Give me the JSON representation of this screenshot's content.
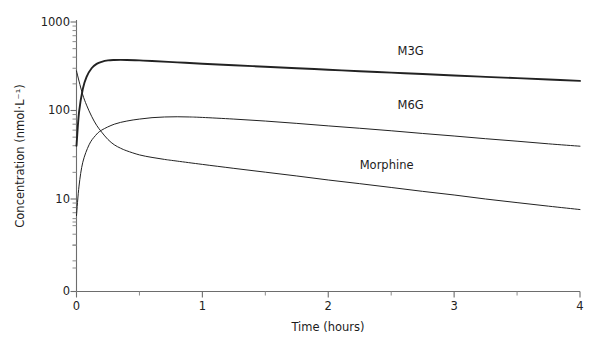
{
  "chart_data": {
    "type": "line",
    "title": "",
    "subtitle": "",
    "xlabel": "Time (hours)",
    "ylabel": "Concentration (nmol·L⁻¹)",
    "xlim": [
      0,
      4
    ],
    "ylim": [
      0,
      1000
    ],
    "yscale": "log",
    "xscale": "linear",
    "grid": false,
    "legend_position": "inline-right",
    "x_ticks": [
      "0",
      "1",
      "2",
      "3",
      "4"
    ],
    "x_tick_values": [
      0,
      1,
      2,
      3,
      4
    ],
    "x_minor_tick_values": [
      0.5,
      1.5,
      2.5,
      3.5
    ],
    "y_ticks": [
      "0",
      "10",
      "100",
      "1000"
    ],
    "y_tick_values": [
      0,
      10,
      100,
      1000
    ],
    "series": [
      {
        "name": "M3G",
        "label": "M3G",
        "color": "#222222",
        "x": [
          0,
          0.02,
          0.05,
          0.08,
          0.12,
          0.16,
          0.2,
          0.25,
          0.3,
          0.35,
          0.4,
          0.5,
          0.6,
          0.8,
          1.0,
          1.25,
          1.5,
          1.75,
          2.0,
          2.25,
          2.5,
          2.75,
          3.0,
          3.25,
          3.5,
          3.75,
          4.0
        ],
        "y": [
          40,
          95,
          175,
          240,
          300,
          336,
          355,
          368,
          372,
          373,
          372,
          368,
          362,
          350,
          338,
          325,
          312,
          300,
          289,
          278,
          268,
          258,
          249,
          240,
          232,
          224,
          216
        ]
      },
      {
        "name": "M6G",
        "label": "M6G",
        "color": "#222222",
        "x": [
          0,
          0.02,
          0.05,
          0.1,
          0.15,
          0.2,
          0.3,
          0.4,
          0.5,
          0.6,
          0.7,
          0.8,
          0.9,
          1.0,
          1.25,
          1.5,
          1.75,
          2.0,
          2.25,
          2.5,
          2.75,
          3.0,
          3.25,
          3.5,
          3.75,
          4.0
        ],
        "y": [
          6.5,
          14,
          26,
          41,
          52,
          60,
          70,
          76,
          80,
          83,
          84.5,
          85,
          84.5,
          83.5,
          80,
          76,
          71.5,
          67,
          63,
          59,
          55,
          51.5,
          48,
          45,
          42,
          39.5
        ]
      },
      {
        "name": "Morphine",
        "label": "Morphine",
        "color": "#222222",
        "x": [
          0,
          0.02,
          0.05,
          0.08,
          0.12,
          0.16,
          0.2,
          0.25,
          0.3,
          0.35,
          0.4,
          0.5,
          0.6,
          0.7,
          0.8,
          1.0,
          1.25,
          1.5,
          1.75,
          2.0,
          2.25,
          2.5,
          2.75,
          3.0,
          3.25,
          3.5,
          3.75,
          4.0
        ],
        "y": [
          280,
          215,
          150,
          115,
          86,
          68,
          57,
          47,
          41,
          37.5,
          35,
          31.5,
          29.5,
          28,
          26.8,
          24.6,
          22.2,
          20.1,
          18.2,
          16.4,
          14.9,
          13.5,
          12.2,
          11.1,
          10.0,
          9.1,
          8.3,
          7.6
        ]
      }
    ],
    "annotations": [
      {
        "text": "M3G",
        "x": 2.55,
        "y": 420
      },
      {
        "text": "M6G",
        "x": 2.55,
        "y": 105
      },
      {
        "text": "Morphine",
        "x": 2.25,
        "y": 22
      }
    ]
  },
  "axes": {
    "y_tick_0": "0",
    "y_tick_10": "10",
    "y_tick_100": "100",
    "y_tick_1000": "1000",
    "x_tick_0": "0",
    "x_tick_1": "1",
    "x_tick_2": "2",
    "x_tick_3": "3",
    "x_tick_4": "4",
    "x_title": "Time (hours)",
    "y_title": "Concentration (nmol·L⁻¹)"
  },
  "labels": {
    "m3g": "M3G",
    "m6g": "M6G",
    "morphine": "Morphine"
  }
}
